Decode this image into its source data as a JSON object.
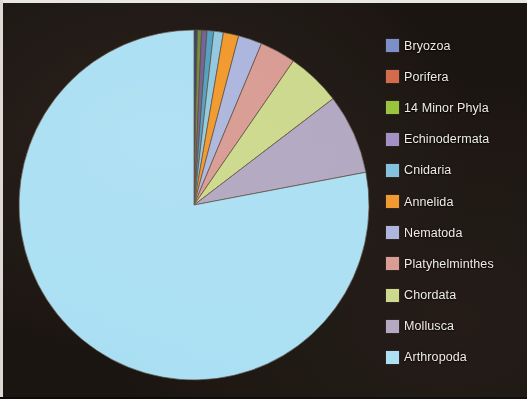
{
  "figure": {
    "background_color": "#1b1511",
    "border_color": "#e9e7e2"
  },
  "legend": {
    "position": "right",
    "text_color": "#efece4",
    "items": [
      {
        "label": "Bryozoa",
        "color": "#7b8ec9"
      },
      {
        "label": "Porifera",
        "color": "#d2694a"
      },
      {
        "label": "14 Minor  Phyla",
        "color": "#97c43b"
      },
      {
        "label": "Echinodermata",
        "color": "#a08ec4"
      },
      {
        "label": "Cnidaria",
        "color": "#7fc0dd"
      },
      {
        "label": "Annelida",
        "color": "#f0972c"
      },
      {
        "label": "Nematoda",
        "color": "#aab4dc"
      },
      {
        "label": "Platyhelminthes",
        "color": "#d79a92"
      },
      {
        "label": "Chordata",
        "color": "#cbd88b"
      },
      {
        "label": "Mollusca",
        "color": "#b0a7c1"
      },
      {
        "label": "Arthropoda",
        "color": "#aadff3"
      }
    ]
  },
  "chart_data": {
    "type": "pie",
    "title": "",
    "subtitle": "",
    "xlabel": "",
    "ylabel": "",
    "grid": false,
    "legend_position": "right",
    "start_angle_deg": 0,
    "direction": "clockwise",
    "center": {
      "cx": 186,
      "cy": 189,
      "r": 175
    },
    "categories": [
      "Bryozoa",
      "Porifera",
      "14 Minor  Phyla",
      "Echinodermata",
      "Cnidaria",
      "Annelida",
      "Nematoda",
      "Platyhelminthes",
      "Chordata",
      "Mollusca",
      "Arthropoda"
    ],
    "values": [
      0.3,
      0.4,
      0.5,
      0.6,
      0.9,
      1.4,
      2.2,
      3.3,
      5.0,
      7.4,
      78.0
    ],
    "colors": [
      "#2e3f6b",
      "#6e8a3a",
      "#6f5f96",
      "#4e9fc0",
      "#8ec8e0",
      "#f0972c",
      "#aab4dc",
      "#d79a92",
      "#cbd88b",
      "#b0a7c1",
      "#aadff3"
    ],
    "slices": [
      {
        "label": "Bryozoa",
        "value": 0.3,
        "color": "#2e3f6b",
        "start_deg": 0.0,
        "end_deg": 1.1
      },
      {
        "label": "Porifera",
        "value": 0.4,
        "color": "#6e8a3a",
        "start_deg": 1.1,
        "end_deg": 2.5
      },
      {
        "label": "14 Minor  Phyla",
        "value": 0.5,
        "color": "#6f5f96",
        "start_deg": 2.5,
        "end_deg": 4.3
      },
      {
        "label": "Echinodermata",
        "value": 0.6,
        "color": "#4e9fc0",
        "start_deg": 4.3,
        "end_deg": 6.5
      },
      {
        "label": "Cnidaria",
        "value": 0.9,
        "color": "#8ec8e0",
        "start_deg": 6.5,
        "end_deg": 9.7
      },
      {
        "label": "Annelida",
        "value": 1.4,
        "color": "#f0972c",
        "start_deg": 9.7,
        "end_deg": 14.8
      },
      {
        "label": "Nematoda",
        "value": 2.2,
        "color": "#aab4dc",
        "start_deg": 14.8,
        "end_deg": 22.7
      },
      {
        "label": "Platyhelminthes",
        "value": 3.3,
        "color": "#d79a92",
        "start_deg": 22.7,
        "end_deg": 34.6
      },
      {
        "label": "Chordata",
        "value": 5.0,
        "color": "#cbd88b",
        "start_deg": 34.6,
        "end_deg": 52.6
      },
      {
        "label": "Mollusca",
        "value": 7.4,
        "color": "#b0a7c1",
        "start_deg": 52.6,
        "end_deg": 79.2
      },
      {
        "label": "Arthropoda",
        "value": 78.0,
        "color": "#aadff3",
        "start_deg": 79.2,
        "end_deg": 360.0
      }
    ]
  }
}
